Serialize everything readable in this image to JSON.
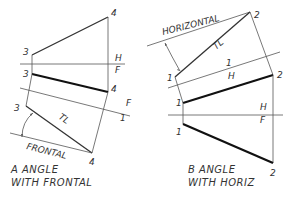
{
  "diagram": {
    "type": "descriptive-geometry-auxiliary-views",
    "panels": [
      {
        "id": "A",
        "caption_line1": "A  ANGLE",
        "caption_line2": "WITH  FRONTAL",
        "labels": {
          "p4_top": "4",
          "p3_top": "3",
          "h": "H",
          "f": "F",
          "p3_front": "3",
          "p4_front": "4",
          "fold_f": "F",
          "fold_1": "1",
          "p3_aux": "3",
          "tl": "TL",
          "frontal": "FRONTAL",
          "p4_aux": "4"
        }
      },
      {
        "id": "B",
        "caption_line1": "B  ANGLE",
        "caption_line2": "WITH  HORIZ",
        "labels": {
          "horizontal": "HORIZONTAL",
          "p2_aux": "2",
          "tl": "TL",
          "p1_aux": "1",
          "fold_1": "1",
          "fold_h": "H",
          "p2_top": "2",
          "p1_top": "1",
          "h": "H",
          "f": "F",
          "p1_front": "1",
          "p2_front": "2"
        }
      }
    ]
  }
}
